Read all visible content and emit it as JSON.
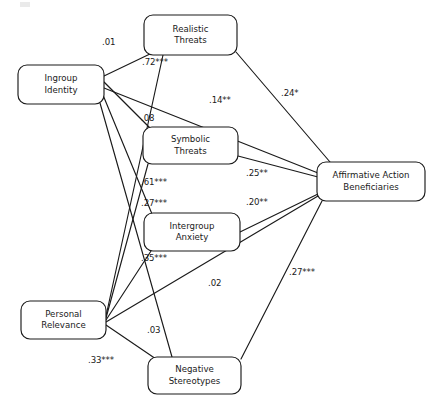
{
  "figure": {
    "type": "path-diagram",
    "title": "",
    "width": 436,
    "height": 412,
    "background": "#ffffff",
    "line_color": "#1a1a1a",
    "text_color": "#1a1a1a"
  },
  "nodes": [
    {
      "id": "ingroup-identity",
      "line1": "Ingroup",
      "line2": "Identity",
      "x": 18,
      "y": 65,
      "w": 86,
      "h": 39
    },
    {
      "id": "personal-relevance",
      "line1": "Personal",
      "line2": "Relevance",
      "x": 21,
      "y": 301,
      "w": 85,
      "h": 38
    },
    {
      "id": "realistic-threats",
      "line1": "Realistic",
      "line2": "Threats",
      "x": 144,
      "y": 15,
      "w": 93,
      "h": 40
    },
    {
      "id": "symbolic-threats",
      "line1": "Symbolic",
      "line2": "Threats",
      "x": 143,
      "y": 127,
      "w": 95,
      "h": 37
    },
    {
      "id": "intergroup-anxiety",
      "line1": "Intergroup",
      "line2": "Anxiety",
      "x": 144,
      "y": 213,
      "w": 96,
      "h": 38
    },
    {
      "id": "negative-stereotypes",
      "line1": "Negative",
      "line2": "Stereotypes",
      "x": 148,
      "y": 357,
      "w": 93,
      "h": 37
    },
    {
      "id": "affirmative-action-beneficiaries",
      "line1": "Affirmative Action",
      "line2": "Beneficiaries",
      "x": 317,
      "y": 162,
      "w": 108,
      "h": 39
    }
  ],
  "edges": [
    {
      "id": "ingroup-to-realistic",
      "from": "ingroup-identity",
      "to": "realistic-threats",
      "x1": 104,
      "y1": 76,
      "x2": 152,
      "y2": 53,
      "coefficient": ".01",
      "significance": "",
      "label_x": 102,
      "label_y": 38
    },
    {
      "id": "ingroup-to-symbolic",
      "from": "ingroup-identity",
      "to": "symbolic-threats",
      "x1": 104,
      "y1": 82,
      "x2": 150,
      "y2": 128,
      "coefficient": ".08",
      "significance": "",
      "label_x": 141,
      "label_y": 114
    },
    {
      "id": "ingroup-to-anxiety",
      "from": "ingroup-identity",
      "to": "intergroup-anxiety",
      "x1": 103,
      "y1": 95,
      "x2": 152,
      "y2": 214,
      "coefficient": ".27",
      "significance": "***",
      "label_x": 141,
      "label_y": 199
    },
    {
      "id": "ingroup-to-stereotypes",
      "from": "ingroup-identity",
      "to": "negative-stereotypes",
      "x1": 100,
      "y1": 103,
      "x2": 172,
      "y2": 357,
      "coefficient": ".03",
      "significance": "",
      "label_x": 147,
      "label_y": 326
    },
    {
      "id": "ingroup-to-outcome",
      "from": "ingroup-identity",
      "to": "affirmative-action-beneficiaries",
      "x1": 104,
      "y1": 88,
      "x2": 318,
      "y2": 173,
      "coefficient": ".14",
      "significance": "**",
      "label_x": 209,
      "label_y": 96
    },
    {
      "id": "personal-to-realistic",
      "from": "personal-relevance",
      "to": "realistic-threats",
      "x1": 106,
      "y1": 316,
      "x2": 163,
      "y2": 55,
      "coefficient": ".72",
      "significance": "***",
      "label_x": 142,
      "label_y": 58
    },
    {
      "id": "personal-to-symbolic",
      "from": "personal-relevance",
      "to": "symbolic-threats",
      "x1": 106,
      "y1": 318,
      "x2": 148,
      "y2": 164,
      "coefficient": ".61",
      "significance": "***",
      "label_x": 141,
      "label_y": 178
    },
    {
      "id": "personal-to-anxiety",
      "from": "personal-relevance",
      "to": "intergroup-anxiety",
      "x1": 106,
      "y1": 320,
      "x2": 151,
      "y2": 251,
      "coefficient": ".35",
      "significance": "***",
      "label_x": 141,
      "label_y": 254
    },
    {
      "id": "personal-to-stereotypes",
      "from": "personal-relevance",
      "to": "negative-stereotypes",
      "x1": 106,
      "y1": 325,
      "x2": 156,
      "y2": 359,
      "coefficient": ".33",
      "significance": "***",
      "label_x": 88,
      "label_y": 356
    },
    {
      "id": "personal-to-outcome",
      "from": "personal-relevance",
      "to": "affirmative-action-beneficiaries",
      "x1": 106,
      "y1": 322,
      "x2": 318,
      "y2": 196,
      "coefficient": ".02",
      "significance": "",
      "label_x": 208,
      "label_y": 279
    },
    {
      "id": "realistic-to-outcome",
      "from": "realistic-threats",
      "to": "affirmative-action-beneficiaries",
      "x1": 236,
      "y1": 52,
      "x2": 330,
      "y2": 162,
      "coefficient": ".24",
      "significance": "*",
      "label_x": 281,
      "label_y": 89
    },
    {
      "id": "symbolic-to-outcome",
      "from": "symbolic-threats",
      "to": "affirmative-action-beneficiaries",
      "x1": 238,
      "y1": 156,
      "x2": 318,
      "y2": 177,
      "coefficient": ".25",
      "significance": "**",
      "label_x": 246,
      "label_y": 169
    },
    {
      "id": "anxiety-to-outcome",
      "from": "intergroup-anxiety",
      "to": "affirmative-action-beneficiaries",
      "x1": 240,
      "y1": 232,
      "x2": 318,
      "y2": 194,
      "coefficient": ".20",
      "significance": "**",
      "label_x": 246,
      "label_y": 198
    },
    {
      "id": "stereotypes-to-outcome",
      "from": "negative-stereotypes",
      "to": "affirmative-action-beneficiaries",
      "x1": 241,
      "y1": 359,
      "x2": 322,
      "y2": 201,
      "coefficient": ".27",
      "significance": "***",
      "label_x": 289,
      "label_y": 268
    }
  ],
  "legend": {
    "note": ""
  }
}
